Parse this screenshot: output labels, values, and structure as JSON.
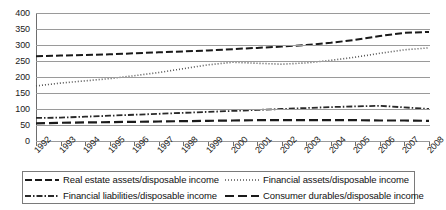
{
  "chart_data": {
    "type": "line",
    "title": "",
    "subtitle": "",
    "xlabel": "",
    "ylabel": "",
    "grid": true,
    "legend_position": "bottom",
    "xlim": [
      1992,
      2008
    ],
    "ylim": [
      0,
      400
    ],
    "ytick_step": 50,
    "categories": [
      "1992",
      "1993",
      "1994",
      "1995",
      "1996",
      "1997",
      "1998",
      "1999",
      "2000",
      "2001",
      "2002",
      "2003",
      "2004",
      "2005",
      "2006",
      "2007",
      "2008"
    ],
    "ytick_labels": [
      "0",
      "50",
      "100",
      "150",
      "200",
      "250",
      "300",
      "350",
      "400"
    ],
    "series": [
      {
        "name": "Real estate assets/disposable income",
        "style": "dashed",
        "color": "#1a1a1a",
        "values": [
          265,
          267,
          269,
          271,
          274,
          277,
          280,
          283,
          287,
          291,
          295,
          300,
          307,
          316,
          328,
          338,
          341
        ]
      },
      {
        "name": "Financial assets/disposable income",
        "style": "dotted",
        "color": "#555555",
        "values": [
          172,
          181,
          188,
          195,
          204,
          214,
          226,
          238,
          246,
          243,
          240,
          244,
          252,
          262,
          274,
          285,
          291
        ]
      },
      {
        "name": "Financial liabilities/disposable income",
        "style": "dash-dot",
        "color": "#2a2a2a",
        "values": [
          72,
          73,
          76,
          79,
          82,
          85,
          88,
          91,
          94,
          97,
          100,
          103,
          106,
          108,
          110,
          105,
          100
        ]
      },
      {
        "name": "Consumer durables/disposable income",
        "style": "long-dash",
        "color": "#1a1a1a",
        "values": [
          55,
          57,
          58,
          59,
          60,
          61,
          62,
          63,
          64,
          65,
          65,
          65,
          65,
          65,
          64,
          64,
          63
        ]
      }
    ]
  },
  "legend": {
    "entries": [
      {
        "label": "Real estate assets/disposable income",
        "series_index": 0,
        "column": "left",
        "row": 0
      },
      {
        "label": "Financial liabilities/disposable income",
        "series_index": 2,
        "column": "left",
        "row": 1
      },
      {
        "label": "Financial assets/disposable income",
        "series_index": 1,
        "column": "right",
        "row": 0
      },
      {
        "label": "Consumer durables/disposable income",
        "series_index": 3,
        "column": "right",
        "row": 1
      }
    ]
  }
}
